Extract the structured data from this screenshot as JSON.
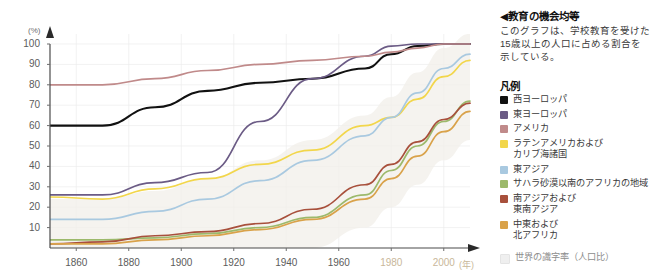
{
  "panel": {
    "title": "◀教育の機会均等",
    "description": "このグラフは、学校教育を受けた15歳以上の人口に占める割合を示している。",
    "legend_heading": "凡例",
    "note_label": "世界の識字率（人口比）"
  },
  "axis": {
    "y_unit": "(%)",
    "x_unit": "(年)",
    "y_ticks": [
      "100",
      "90",
      "80",
      "70",
      "60",
      "50",
      "40",
      "30",
      "20",
      "10"
    ],
    "x_ticks": [
      "1860",
      "1880",
      "1900",
      "1920",
      "1940",
      "1960",
      "1980",
      "2000"
    ]
  },
  "chart_data": {
    "type": "line",
    "title": "教育の機会均等",
    "subtitle": "このグラフは、学校教育を受けた15歳以上の人口に占める割合を示している。",
    "xlabel": "(年)",
    "ylabel": "(%)",
    "xlim": [
      1850,
      2010
    ],
    "ylim": [
      0,
      105
    ],
    "grid": true,
    "legend_position": "right",
    "x": [
      1850,
      1870,
      1890,
      1910,
      1930,
      1950,
      1970,
      1980,
      1990,
      2000,
      2010
    ],
    "series": [
      {
        "name": "西ヨーロッパ",
        "color": "#111111",
        "values": [
          60,
          60,
          69,
          77,
          81,
          83,
          88,
          95,
          99,
          100,
          100
        ]
      },
      {
        "name": "東ヨーロッパ",
        "color": "#6b5b85",
        "values": [
          26,
          26,
          32,
          37,
          62,
          83,
          94,
          99,
          100,
          100,
          100
        ]
      },
      {
        "name": "アメリカ",
        "color": "#c08a8a",
        "values": [
          80,
          80,
          83,
          87,
          90,
          92,
          94,
          96,
          98,
          100,
          100
        ]
      },
      {
        "name": "ラテンアメリカおよびカリブ海諸国",
        "color": "#f2d64b",
        "values": [
          25,
          24,
          29,
          34,
          41,
          48,
          60,
          64,
          73,
          84,
          92
        ]
      },
      {
        "name": "東アジア",
        "color": "#a9c9e0",
        "values": [
          14,
          14,
          18,
          24,
          33,
          43,
          55,
          64,
          76,
          88,
          95
        ]
      },
      {
        "name": "サハラ砂漠以南のアフリカの地域",
        "color": "#9cb96b",
        "values": [
          4,
          4,
          5,
          7,
          10,
          15,
          26,
          38,
          50,
          62,
          72
        ]
      },
      {
        "name": "南アジアおよび東南アジア",
        "color": "#a8503c",
        "values": [
          2,
          3,
          6,
          8,
          12,
          19,
          31,
          41,
          52,
          63,
          71
        ]
      },
      {
        "name": "中東および北アフリカ",
        "color": "#d9a24a",
        "values": [
          2,
          2,
          4,
          6,
          9,
          14,
          24,
          34,
          45,
          57,
          67
        ]
      }
    ],
    "background_band": {
      "name": "世界の識字率（人口比）",
      "color": "#f2efe9"
    }
  },
  "legend_items": [
    {
      "label": "西ヨーロッパ",
      "color": "#111111"
    },
    {
      "label": "東ヨーロッパ",
      "color": "#6b5b85"
    },
    {
      "label": "アメリカ",
      "color": "#c08a8a"
    },
    {
      "label": "ラテンアメリカおよび",
      "label2": "カリブ海諸国",
      "color": "#f2d64b"
    },
    {
      "label": "東アジア",
      "color": "#a9c9e0"
    },
    {
      "label": "サハラ砂漠以南のアフリカの地域",
      "color": "#9cb96b"
    },
    {
      "label": "南アジアおよび",
      "label2": "東南アジア",
      "color": "#a8503c"
    },
    {
      "label": "中東および",
      "label2": "北アフリカ",
      "color": "#d9a24a"
    }
  ]
}
